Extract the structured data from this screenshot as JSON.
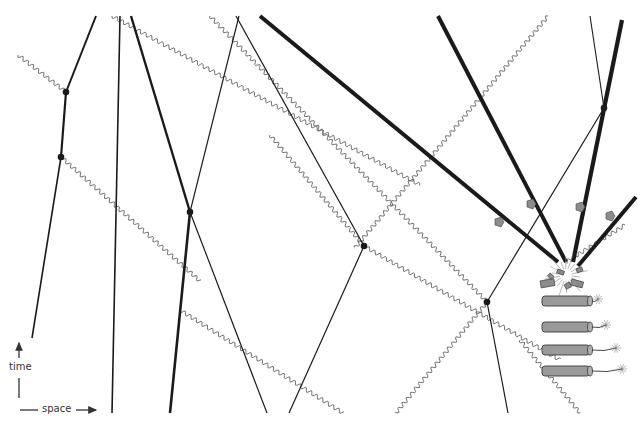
{
  "axes": {
    "time_label": "time",
    "space_label": "space"
  },
  "colors": {
    "worldline": "#1a1a1a",
    "photon": "#6e6e6e",
    "debris": "#8c8c8c",
    "dynamite_fill": "#9a9a9a",
    "dynamite_stroke": "#3a3a3a"
  },
  "diagram": {
    "worldlines": [
      {
        "name": "wl-a",
        "x1": 96,
        "y1": 16,
        "x2": 66,
        "y2": 92,
        "w": 2
      },
      {
        "name": "wl-a2",
        "x1": 66,
        "y1": 92,
        "x2": 61,
        "y2": 157,
        "w": 2.2
      },
      {
        "name": "wl-a3",
        "x1": 61,
        "y1": 157,
        "x2": 32,
        "y2": 338,
        "w": 1.6
      },
      {
        "name": "wl-b",
        "x1": 120,
        "y1": 16,
        "x2": 112,
        "y2": 413,
        "w": 1.6
      },
      {
        "name": "wl-c",
        "x1": 131,
        "y1": 16,
        "x2": 190,
        "y2": 212,
        "w": 2.4
      },
      {
        "name": "wl-c2",
        "x1": 190,
        "y1": 212,
        "x2": 170,
        "y2": 413,
        "w": 2.6
      },
      {
        "name": "wl-d",
        "x1": 239,
        "y1": 16,
        "x2": 190,
        "y2": 212,
        "w": 1.2
      },
      {
        "name": "wl-d2",
        "x1": 190,
        "y1": 212,
        "x2": 267,
        "y2": 413,
        "w": 1.2
      },
      {
        "name": "wl-e",
        "x1": 236,
        "y1": 16,
        "x2": 364,
        "y2": 246,
        "w": 1.2
      },
      {
        "name": "wl-e2",
        "x1": 364,
        "y1": 246,
        "x2": 289,
        "y2": 413,
        "w": 1.2
      },
      {
        "name": "wl-f",
        "x1": 487,
        "y1": 302,
        "x2": 508,
        "y2": 413,
        "w": 1.2
      },
      {
        "name": "wl-f2",
        "x1": 487,
        "y1": 302,
        "x2": 604,
        "y2": 108,
        "w": 1.2
      },
      {
        "name": "wl-g",
        "x1": 590,
        "y1": 16,
        "x2": 604,
        "y2": 108,
        "w": 1.1
      }
    ],
    "debris_lines": [
      {
        "name": "debris-1",
        "x1": 260,
        "y1": 16,
        "x2": 558,
        "y2": 262,
        "w": 4,
        "marker": [
          499,
          222
        ]
      },
      {
        "name": "debris-2",
        "x1": 438,
        "y1": 16,
        "x2": 566,
        "y2": 262,
        "w": 4,
        "marker": [
          531,
          204
        ]
      },
      {
        "name": "debris-3",
        "x1": 622,
        "y1": 20,
        "x2": 573,
        "y2": 262,
        "w": 4.2,
        "marker": [
          580,
          207
        ]
      },
      {
        "name": "debris-4",
        "x1": 636,
        "y1": 197,
        "x2": 578,
        "y2": 266,
        "w": 4,
        "marker": [
          610,
          216
        ]
      }
    ],
    "photons": [
      {
        "name": "photon-1",
        "x1": 18,
        "y1": 55,
        "x2": 66,
        "y2": 92
      },
      {
        "name": "photon-2",
        "x1": 61,
        "y1": 157,
        "x2": 200,
        "y2": 281
      },
      {
        "name": "photon-3",
        "x1": 112,
        "y1": 16,
        "x2": 420,
        "y2": 185
      },
      {
        "name": "photon-4",
        "x1": 210,
        "y1": 16,
        "x2": 487,
        "y2": 302
      },
      {
        "name": "photon-5",
        "x1": 270,
        "y1": 135,
        "x2": 364,
        "y2": 246
      },
      {
        "name": "photon-6",
        "x1": 364,
        "y1": 246,
        "x2": 560,
        "y2": 360
      },
      {
        "name": "photon-7",
        "x1": 180,
        "y1": 310,
        "x2": 343,
        "y2": 413
      },
      {
        "name": "photon-8",
        "x1": 548,
        "y1": 16,
        "x2": 355,
        "y2": 248
      },
      {
        "name": "photon-9",
        "x1": 487,
        "y1": 302,
        "x2": 396,
        "y2": 413
      },
      {
        "name": "photon-10",
        "x1": 520,
        "y1": 340,
        "x2": 580,
        "y2": 413
      },
      {
        "name": "photon-11",
        "x1": 625,
        "y1": 225,
        "x2": 566,
        "y2": 262
      }
    ],
    "events": [
      {
        "name": "event-1",
        "x": 66,
        "y": 92
      },
      {
        "name": "event-2",
        "x": 61,
        "y": 157
      },
      {
        "name": "event-3",
        "x": 190,
        "y": 212
      },
      {
        "name": "event-4",
        "x": 364,
        "y": 246
      },
      {
        "name": "event-5",
        "x": 487,
        "y": 302
      },
      {
        "name": "event-6",
        "x": 604,
        "y": 108
      }
    ],
    "dynamite_sticks": [
      {
        "name": "dynamite-stick-1",
        "x": 542,
        "y": 296,
        "fuse_len": 6
      },
      {
        "name": "dynamite-stick-2",
        "x": 542,
        "y": 322,
        "fuse_len": 14
      },
      {
        "name": "dynamite-stick-3",
        "x": 542,
        "y": 345,
        "fuse_len": 24
      },
      {
        "name": "dynamite-stick-4",
        "x": 542,
        "y": 366,
        "fuse_len": 30
      }
    ],
    "explosion": {
      "x": 566,
      "y": 275
    }
  }
}
